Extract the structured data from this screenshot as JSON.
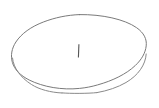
{
  "canvas": {
    "width": 159,
    "height": 108,
    "background_color": "#ffffff",
    "description": "Hand-drawn style ellipse outline with a small vertical caret mark near its center"
  },
  "shapes": {
    "ellipse": {
      "name": "ellipse-outline",
      "center_x": 79,
      "center_y": 54,
      "radius_x": 67,
      "radius_y": 39.5,
      "stroke_color": "#7a7a7a",
      "stroke_width": 1,
      "fill": "none",
      "bounds": {
        "left": 12,
        "top": 14.5,
        "right": 146,
        "bottom": 93.5
      }
    },
    "caret": {
      "name": "caret-mark",
      "text": "|",
      "x": 78.5,
      "y_top": 44,
      "y_bottom": 57.5,
      "length": 13.5,
      "stroke_color": "#555555",
      "stroke_width": 1
    }
  }
}
